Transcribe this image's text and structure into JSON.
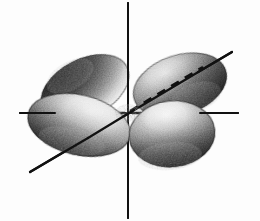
{
  "figure": {
    "kind": "chemistry-orbital-sketch",
    "background_color": "#fdfdfd",
    "ink_color": "#1a1a1a",
    "shade_dark": "#3a3a3a",
    "shade_mid": "#8d8d8d",
    "shade_light": "#e8e8e8",
    "width": 260,
    "height": 221
  },
  "origin": {
    "x": 128,
    "y": 113
  },
  "axes": [
    {
      "name": "vertical-axis",
      "label": "z",
      "style": "solid",
      "x1": 128,
      "y1": 3,
      "x2": 128,
      "y2": 218,
      "stroke_width": 2.0
    },
    {
      "name": "horizontal-axis",
      "label": "y",
      "style": "solid",
      "x1": 20,
      "y1": 113,
      "x2": 238,
      "y2": 113,
      "stroke_width": 2.0
    },
    {
      "name": "diagonal-axis",
      "label": "x",
      "style": "solid",
      "x1": 30,
      "y1": 172,
      "x2": 232,
      "y2": 52,
      "stroke_width": 2.2
    }
  ],
  "hidden_lines": [
    {
      "name": "horizontal-axis-hidden-segment",
      "style": "dashed",
      "x1": 52,
      "y1": 113,
      "x2": 205,
      "y2": 113,
      "dash": "9 7",
      "stroke_width": 2.4
    },
    {
      "name": "diagonal-axis-hidden-segment",
      "style": "dashed",
      "x1": 130,
      "y1": 111,
      "x2": 203,
      "y2": 67,
      "dash": "9 7",
      "stroke_width": 2.6
    }
  ],
  "lobes": [
    {
      "name": "upper-left-lobe",
      "position": "upper-left",
      "description": "rear lobe pointing up and to the left, heavily shaded on its upper-left flank",
      "cx": 85,
      "cy": 88,
      "rx": 47,
      "ry": 29,
      "rotation": -27,
      "shade": "dark-upper-left"
    },
    {
      "name": "lower-left-lobe",
      "position": "lower-left",
      "description": "front lobe pointing down and to the left, light on top with dark underside",
      "cx": 79,
      "cy": 125,
      "rx": 52,
      "ry": 30,
      "rotation": 13,
      "shade": "light-top-dark-bottom"
    },
    {
      "name": "upper-right-lobe",
      "position": "upper-right",
      "description": "rear lobe pointing up and to the right, shaded along its lower and right edges",
      "cx": 180,
      "cy": 85,
      "rx": 48,
      "ry": 30,
      "rotation": -18,
      "shade": "dark-lower-right"
    },
    {
      "name": "lower-right-lobe",
      "position": "lower-right",
      "description": "front lobe pointing down and to the right, light crown with dark shaded base",
      "cx": 172,
      "cy": 134,
      "rx": 43,
      "ry": 33,
      "rotation": -6,
      "shade": "light-top-dark-bottom"
    }
  ],
  "lobe_count": 4,
  "symmetry": "four-lobed, lobes lie between the axes"
}
